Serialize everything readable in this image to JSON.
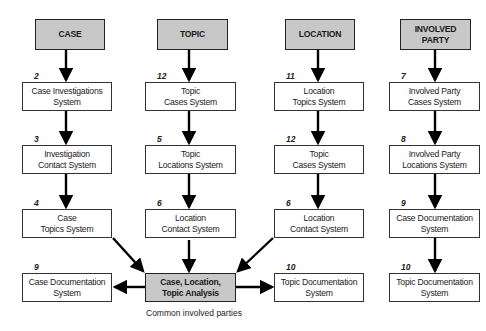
{
  "headers": [
    {
      "label": "CASE"
    },
    {
      "label": "TOPIC"
    },
    {
      "label": "LOCATION"
    },
    {
      "label": "INVOLVED\nPARTY"
    }
  ],
  "columns": [
    {
      "steps": [
        {
          "num": "2",
          "label": "Case Investigations\nSystem"
        },
        {
          "num": "3",
          "label": "Investigation\nContact System"
        },
        {
          "num": "4",
          "label": "Case\nTopics System"
        },
        {
          "num": "9",
          "label": "Case Documentation\nSystem"
        }
      ]
    },
    {
      "steps": [
        {
          "num": "12",
          "label": "Topic\nCases System"
        },
        {
          "num": "5",
          "label": "Topic\nLocations System"
        },
        {
          "num": "6",
          "label": "Location\nContact  System"
        }
      ]
    },
    {
      "steps": [
        {
          "num": "11",
          "label": "Location\nTopics System"
        },
        {
          "num": "12",
          "label": "Topic\nCases System"
        },
        {
          "num": "6",
          "label": "Location\nContact System"
        },
        {
          "num": "10",
          "label": "Topic Documentation\nSystem"
        }
      ]
    },
    {
      "steps": [
        {
          "num": "7",
          "label": "Involved Party\nCases System"
        },
        {
          "num": "8",
          "label": "Involved Party\nLocations System"
        },
        {
          "num": "9",
          "label": "Case Documentation\nSystem"
        },
        {
          "num": "10",
          "label": "Topic Documentation\nSystem"
        }
      ]
    }
  ],
  "center": {
    "label": "Case, Location,\nTopic Analysis",
    "caption": "Common involved parties"
  }
}
